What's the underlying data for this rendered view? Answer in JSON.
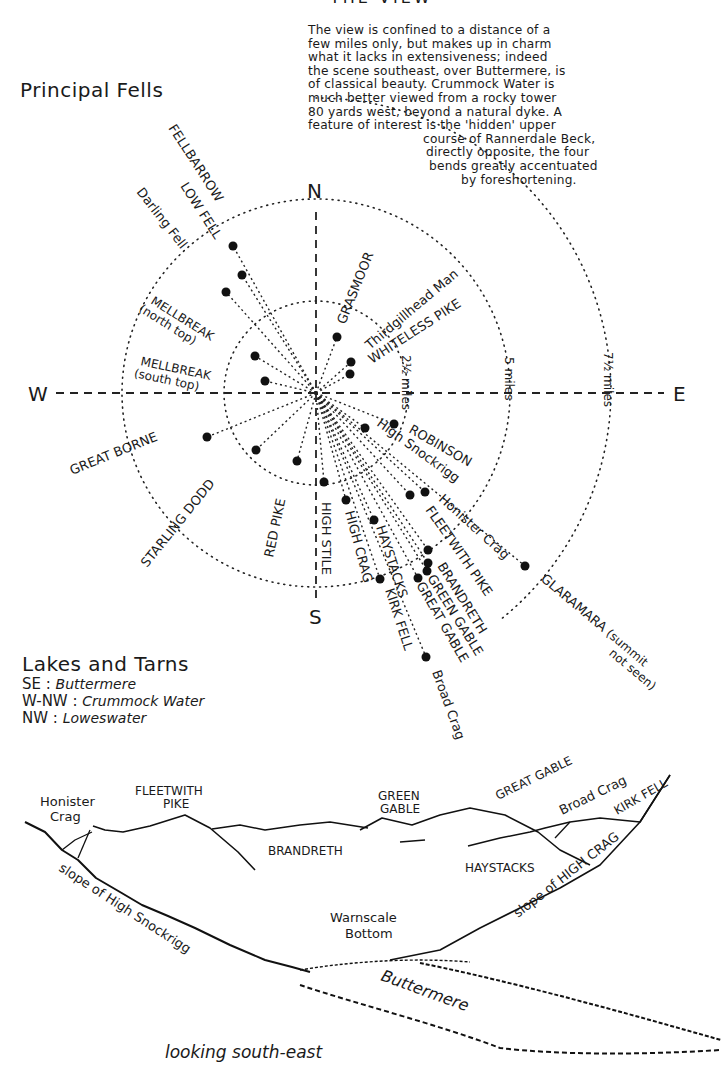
{
  "header": {
    "title_partial": "THE VIEW",
    "intro_lines": [
      "The view is confined to a distance of a",
      "few miles only, but makes up in charm",
      "what it lacks in extensiveness; indeed",
      "the scene southeast, over Buttermere, is",
      "of classical beauty.   Crummock Water is",
      "much better viewed from a rocky tower",
      "80 yards west, beyond a natural dyke. A",
      "feature of interest is the 'hidden' upper",
      "course of Rannerdale Beck,",
      "directly opposite, the four",
      "bends greatly accentuated",
      "by foreshortening."
    ]
  },
  "compass": {
    "section_title": "Principal Fells",
    "center": {
      "x": 316,
      "y": 393
    },
    "cardinals": {
      "N": "N",
      "S": "S",
      "E": "E",
      "W": "W"
    },
    "rings": [
      {
        "label": "2½ miles",
        "radius": 92
      },
      {
        "label": "5 miles",
        "radius": 194
      },
      {
        "label": "7½ miles",
        "radius": 295
      }
    ],
    "fells": [
      {
        "name": "FELLBARROW",
        "x": 233,
        "y": 246
      },
      {
        "name": "LOW FELL",
        "x": 242,
        "y": 275
      },
      {
        "name": "Darling Fell",
        "x": 226,
        "y": 292
      },
      {
        "name": "MELLBREAK (north top)",
        "x": 255,
        "y": 356
      },
      {
        "name": "MELLBREAK (south top)",
        "x": 265,
        "y": 381
      },
      {
        "name": "GREAT BORNE",
        "x": 207,
        "y": 437
      },
      {
        "name": "STARLING DODD",
        "x": 256,
        "y": 450
      },
      {
        "name": "RED PIKE",
        "x": 297,
        "y": 461
      },
      {
        "name": "HIGH STILE",
        "x": 324,
        "y": 482
      },
      {
        "name": "HIGH CRAG",
        "x": 346,
        "y": 500
      },
      {
        "name": "HAYSTACKS",
        "x": 374,
        "y": 520
      },
      {
        "name": "KIRK FELL",
        "x": 380,
        "y": 579
      },
      {
        "name": "GREAT GABLE",
        "x": 418,
        "y": 578
      },
      {
        "name": "GREEN GABLE",
        "x": 427,
        "y": 571
      },
      {
        "name": "BRANDRETH",
        "x": 428,
        "y": 563
      },
      {
        "name": "FLEETWITH PIKE",
        "x": 428,
        "y": 550
      },
      {
        "name": "Honister Crag",
        "x": 425,
        "y": 492
      },
      {
        "name": "High Snockrigg",
        "x": 365,
        "y": 428
      },
      {
        "name": "ROBINSON",
        "x": 394,
        "y": 424
      },
      {
        "name": "GLARAMARA (summit not seen)",
        "x": 525,
        "y": 566
      },
      {
        "name": "Broad Crag",
        "x": 426,
        "y": 657
      },
      {
        "name": "GRASMOOR",
        "x": 337,
        "y": 337
      },
      {
        "name": "Thirdgillhead Man",
        "x": 351,
        "y": 362
      },
      {
        "name": "WHITELESS PIKE",
        "x": 350,
        "y": 374
      }
    ]
  },
  "lakes": {
    "title": "Lakes and Tarns",
    "items": [
      {
        "direction": "SE",
        "name": "Buttermere"
      },
      {
        "direction": "W-NW",
        "name": "Crummock Water"
      },
      {
        "direction": "NW",
        "name": "Loweswater"
      }
    ]
  },
  "panorama": {
    "labels": {
      "honister_crag": [
        "Honister",
        "Crag"
      ],
      "fleetwith_pike": [
        "FLEETWITH",
        "PIKE"
      ],
      "brandreth": "BRANDRETH",
      "green_gable": [
        "GREEN",
        "GABLE"
      ],
      "great_gable": "GREAT GABLE",
      "broad_crag": "Broad Crag",
      "kirk_fell": "KIRK FELL",
      "haystacks": "HAYSTACKS",
      "slope_high_snockrigg": "slope of High Snockrigg",
      "slope_high_crag": "slope of HIGH CRAG",
      "warnscale": [
        "Warnscale",
        "Bottom"
      ],
      "buttermere": "Buttermere"
    },
    "caption": "looking south-east"
  }
}
